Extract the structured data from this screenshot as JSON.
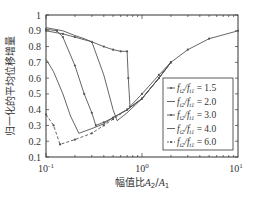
{
  "chart_data": {
    "type": "line",
    "title": "",
    "xlabel": "幅值比A2/A1",
    "ylabel": "归一化的平均位移增量",
    "xscale": "log",
    "xlim": [
      0.1,
      10
    ],
    "ylim": [
      0.1,
      1
    ],
    "x_ticks": [
      "10^-1",
      "10^0",
      "10^1"
    ],
    "y_ticks": [
      "0.1",
      "0.2",
      "0.3",
      "0.4",
      "0.5",
      "0.6",
      "0.7",
      "0.8",
      "0.9",
      "1"
    ],
    "grid": false,
    "legend_position": "lower right",
    "series": [
      {
        "name": "f_t2/f_t1 = 1.5",
        "marker": "dot",
        "dash": "solid",
        "x": [
          0.1,
          0.15,
          0.2,
          0.3,
          0.4,
          0.5,
          0.6,
          0.7,
          0.72,
          0.75,
          1.0,
          1.5,
          2.0,
          3.0,
          5.0,
          10.0
        ],
        "y": [
          0.9,
          0.88,
          0.86,
          0.83,
          0.8,
          0.78,
          0.77,
          0.77,
          0.6,
          0.42,
          0.5,
          0.62,
          0.7,
          0.78,
          0.85,
          0.9
        ]
      },
      {
        "name": "f_t2/f_t1 = 2.0",
        "marker": "none",
        "dash": "solid",
        "x": [
          0.1,
          0.15,
          0.2,
          0.25,
          0.3,
          0.4,
          0.5,
          0.55,
          0.7,
          1.0,
          1.5,
          2.0
        ],
        "y": [
          0.92,
          0.9,
          0.87,
          0.85,
          0.83,
          0.62,
          0.4,
          0.33,
          0.38,
          0.47,
          0.6,
          0.7
        ]
      },
      {
        "name": "f_t2/f_t1 = 3.0",
        "marker": "dot",
        "dash": "solid",
        "x": [
          0.1,
          0.13,
          0.15,
          0.2,
          0.25,
          0.3,
          0.33,
          0.4,
          0.5,
          0.7,
          1.0,
          1.5,
          2.0
        ],
        "y": [
          0.91,
          0.9,
          0.86,
          0.68,
          0.5,
          0.38,
          0.3,
          0.32,
          0.35,
          0.4,
          0.47,
          0.6,
          0.7
        ]
      },
      {
        "name": "f_t2/f_t1 = 4.0",
        "marker": "none",
        "dash": "solid",
        "x": [
          0.1,
          0.12,
          0.15,
          0.18,
          0.22,
          0.3,
          0.4,
          0.5,
          0.7,
          1.0,
          1.5,
          2.0
        ],
        "y": [
          0.72,
          0.64,
          0.5,
          0.36,
          0.25,
          0.28,
          0.31,
          0.35,
          0.4,
          0.47,
          0.6,
          0.7
        ]
      },
      {
        "name": "f_t2/f_t1 = 6.0",
        "marker": "dot",
        "dash": "dashed",
        "x": [
          0.1,
          0.12,
          0.14,
          0.2,
          0.3,
          0.4,
          0.5,
          0.7,
          1.0,
          1.5,
          2.0
        ],
        "y": [
          0.37,
          0.3,
          0.18,
          0.21,
          0.25,
          0.3,
          0.34,
          0.4,
          0.47,
          0.6,
          0.7
        ]
      }
    ]
  },
  "axes": {
    "x_tick_labels": [
      {
        "base": "10",
        "exp": "-1"
      },
      {
        "base": "10",
        "exp": "0"
      },
      {
        "base": "10",
        "exp": "1"
      }
    ],
    "y_tick_labels": [
      "0.1",
      "0.2",
      "0.3",
      "0.4",
      "0.5",
      "0.6",
      "0.7",
      "0.8",
      "0.9",
      "1"
    ],
    "xlabel_prefix": "幅值比",
    "xlabel_var1": "A",
    "xlabel_sub1": "2",
    "xlabel_sep": "/",
    "xlabel_var2": "A",
    "xlabel_sub2": "1",
    "ylabel": "归一化的平均位移增量"
  },
  "legend": {
    "entries": [
      {
        "prefix": "f",
        "sub1": "t2",
        "mid": "/f",
        "sub2": "t1",
        "value": " = 1.5"
      },
      {
        "prefix": "f",
        "sub1": "t2",
        "mid": "/f",
        "sub2": "t1",
        "value": " = 2.0"
      },
      {
        "prefix": "f",
        "sub1": "t2",
        "mid": "/f",
        "sub2": "t1",
        "value": " = 3.0"
      },
      {
        "prefix": "f",
        "sub1": "t2",
        "mid": "/f",
        "sub2": "t1",
        "value": " = 4.0"
      },
      {
        "prefix": "f",
        "sub1": "t2",
        "mid": "/f",
        "sub2": "t1",
        "value": " = 6.0"
      }
    ]
  },
  "colors": {
    "line": "#555555",
    "axis": "#333333",
    "background": "#ffffff"
  }
}
